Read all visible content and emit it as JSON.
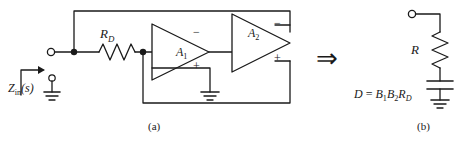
{
  "figure": {
    "background": "#ffffff",
    "line_color": "#1a1a1a",
    "text_color": "#1a1a1a"
  },
  "panel_a": {
    "caption": "(a)",
    "input_label_main": "Z",
    "input_label_sub": "in",
    "input_label_tail": "(s)",
    "resistor_label_main": "R",
    "resistor_label_sub": "D",
    "opamp1_label_main": "A",
    "opamp1_label_sub": "1",
    "opamp2_label_main": "A",
    "opamp2_label_sub": "2",
    "opamp1_minus": "−",
    "opamp1_plus": "+",
    "opamp2_minus": "−",
    "opamp2_plus": "+",
    "components": [
      "input-terminal",
      "resistor-RD",
      "opamp-A1",
      "opamp-A2",
      "ground-A1-noninverting",
      "ground-input",
      "top-feedback-wire",
      "bottom-feedback-wire"
    ]
  },
  "arrow": {
    "glyph": "⇒",
    "name": "implies-arrow"
  },
  "panel_b": {
    "caption": "(b)",
    "resistor_label": "R",
    "equation_lhs": "D",
    "equation_eq": " = ",
    "equation_b1": "B",
    "equation_b1_sub": "1",
    "equation_b2": "B",
    "equation_b2_sub": "2",
    "equation_r": "R",
    "equation_r_sub": "D",
    "components": [
      "terminal-node",
      "resistor-R",
      "capacitor-D",
      "ground"
    ]
  }
}
